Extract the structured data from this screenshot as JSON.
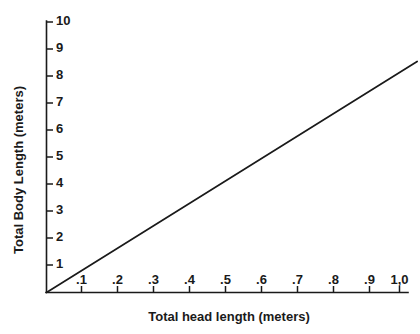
{
  "chart_data": {
    "type": "line",
    "title": "",
    "subtitle": "",
    "xlabel": "Total head length (meters)",
    "ylabel": "Total Body Length (meters)",
    "xlim": [
      0,
      1.05
    ],
    "ylim": [
      0,
      10
    ],
    "grid": false,
    "legend": null,
    "legend_position": "none",
    "x_ticks": [
      0.1,
      0.2,
      0.3,
      0.4,
      0.5,
      0.6,
      0.7,
      0.8,
      0.9,
      1.0
    ],
    "x_tick_labels": [
      ".1",
      ".2",
      ".3",
      ".4",
      ".5",
      ".6",
      ".7",
      ".8",
      ".9",
      "1,0"
    ],
    "y_ticks": [
      1,
      2,
      3,
      4,
      5,
      6,
      7,
      8,
      9,
      10
    ],
    "y_tick_labels": [
      "1",
      "2",
      "3",
      "4",
      "5",
      "6",
      "7",
      "8",
      "9",
      "10"
    ],
    "series": [
      {
        "name": "Body length vs head length",
        "slope": 8,
        "intercept": 0,
        "x": [
          0,
          1.05
        ],
        "values": [
          0,
          8.4
        ],
        "points": [
          {
            "x": 0.0,
            "y": 0.0
          },
          {
            "x": 0.1,
            "y": 0.8
          },
          {
            "x": 0.2,
            "y": 1.6
          },
          {
            "x": 0.3,
            "y": 2.4
          },
          {
            "x": 0.4,
            "y": 3.2
          },
          {
            "x": 0.5,
            "y": 4.0
          },
          {
            "x": 0.6,
            "y": 4.8
          },
          {
            "x": 0.7,
            "y": 5.6
          },
          {
            "x": 0.8,
            "y": 6.4
          },
          {
            "x": 0.9,
            "y": 7.2
          },
          {
            "x": 1.0,
            "y": 8.0
          }
        ],
        "color": "#1a1a1a"
      }
    ],
    "annotations": [],
    "colors": {
      "background": "#ffffff",
      "axis": "#1a1a1a",
      "line": "#1a1a1a",
      "text": "#1a1a1a"
    }
  }
}
